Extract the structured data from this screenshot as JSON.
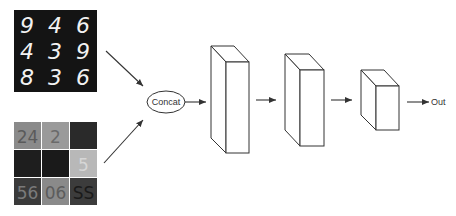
{
  "diagram": {
    "title": "",
    "inputs": {
      "mnist": {
        "name": "MNIST digit grid",
        "digits": [
          [
            "9",
            "4",
            "6"
          ],
          [
            "4",
            "3",
            "9"
          ],
          [
            "8",
            "3",
            "6"
          ]
        ],
        "background": "#141414",
        "foreground": "#f2f2f2"
      },
      "svhn": {
        "name": "SVHN image grid",
        "tiles": [
          {
            "text": "24",
            "bg": "#8a8a8a",
            "fg": "#5a5a5a"
          },
          {
            "text": "2",
            "bg": "#9a9a9a",
            "fg": "#6a6a6a"
          },
          {
            "text": "",
            "bg": "#2a2a2a",
            "fg": "#111111"
          },
          {
            "text": "",
            "bg": "#1e1e1e",
            "fg": "#2a2a2a"
          },
          {
            "text": "",
            "bg": "#1a1a1a",
            "fg": "#222222"
          },
          {
            "text": "5",
            "bg": "#b8b8b8",
            "fg": "#d6d6d6"
          },
          {
            "text": "56",
            "bg": "#3a3a3a",
            "fg": "#7a7a7a"
          },
          {
            "text": "06",
            "bg": "#8a8a8a",
            "fg": "#5c5c5c"
          },
          {
            "text": "SS",
            "bg": "#3c3c3c",
            "fg": "#1a1a1a"
          }
        ]
      }
    },
    "nodes": {
      "concat": {
        "label": "Concat"
      },
      "layers": [
        {
          "name": "layer-1"
        },
        {
          "name": "layer-2"
        },
        {
          "name": "layer-3"
        }
      ],
      "output": {
        "label": "Out"
      }
    },
    "colors": {
      "stroke": "#333333",
      "background": "#ffffff"
    }
  }
}
